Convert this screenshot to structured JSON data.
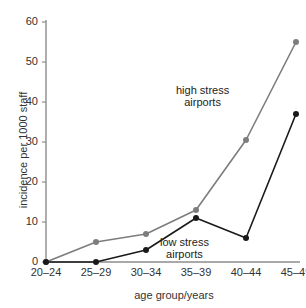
{
  "chart_data": {
    "type": "line",
    "title": "",
    "xlabel": "age group/years",
    "ylabel": "incidence per 1000 staff",
    "categories": [
      "20–24",
      "25–29",
      "30–34",
      "35–39",
      "40–44",
      "45–49"
    ],
    "ylim": [
      0,
      60
    ],
    "yticks": [
      "0",
      "10",
      "20",
      "30",
      "40",
      "50",
      "60"
    ],
    "ytick_values": [
      0,
      10,
      20,
      30,
      40,
      50,
      60
    ],
    "grid": false,
    "legend_position": "inline-annotation",
    "series": [
      {
        "name": "high stress airports",
        "color": "#7d7d7d",
        "marker": "circle",
        "values": [
          0,
          5,
          7,
          13,
          30.5,
          55
        ]
      },
      {
        "name": "low stress airports",
        "color": "#1a1a1a",
        "marker": "circle",
        "values": [
          0,
          0,
          3,
          11,
          6,
          37
        ]
      }
    ],
    "annotations": [
      {
        "id": "high",
        "text_line1": "high stress",
        "text_line2": "airports"
      },
      {
        "id": "low",
        "text_line1": "low stress",
        "text_line2": "airports"
      }
    ]
  },
  "colors": {
    "background": "#ffffff",
    "axis": "#8c8c8c",
    "text": "#333333",
    "high_stress": "#7d7d7d",
    "low_stress": "#1a1a1a"
  }
}
